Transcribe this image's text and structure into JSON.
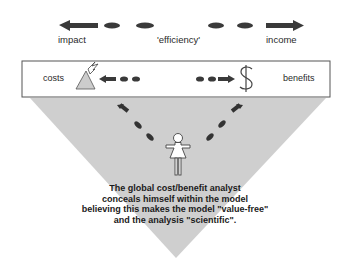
{
  "top_axis": {
    "left_label": "impact",
    "center_label": "'efficiency'",
    "right_label": "income"
  },
  "box": {
    "left_label": "costs",
    "right_label": "benefits",
    "left_icon": "mountain-lightning-icon",
    "right_icon": "dollar-icon"
  },
  "figure": {
    "icon": "person-icon"
  },
  "caption": {
    "line1": "The global cost/benefit analyst",
    "line2": "conceals himself within the model",
    "line3": "believing this makes the model \"value-free\"",
    "line4": "and the analysis \"scientific\"."
  },
  "colors": {
    "triangle_fill": "#cfcfcf",
    "arrow": "#3a3a3a",
    "box_border": "#555555"
  }
}
